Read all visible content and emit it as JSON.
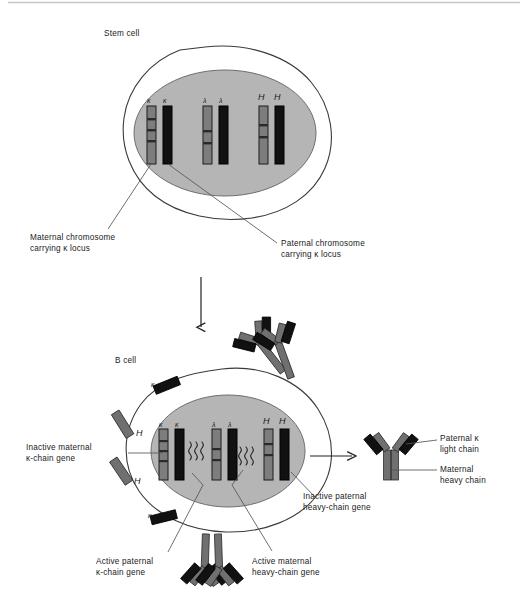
{
  "figure": {
    "type": "biology-diagram",
    "topic": "Allelic exclusion in immunoglobulin gene expression",
    "top_rule_color": "#bfbfbf"
  },
  "colors": {
    "cytoplasm": "#ffffff",
    "nucleus": "#b5b5b5",
    "maternal_chromosome": "#7d7d7d",
    "paternal_chromosome": "#111111",
    "heavy_chain_protein": "#707070",
    "light_chain_protein": "#111111",
    "outline": "#333333",
    "leader_line": "#555555"
  },
  "stem_cell": {
    "title": "Stem cell",
    "chromosome_pairs": [
      {
        "locus": "kappa",
        "labels": [
          "κ",
          "κ"
        ],
        "left": {
          "origin": "maternal",
          "shade": "gray"
        },
        "right": {
          "origin": "paternal",
          "shade": "black"
        }
      },
      {
        "locus": "lambda",
        "labels": [
          "λ",
          "λ"
        ],
        "left": {
          "origin": "maternal",
          "shade": "gray"
        },
        "right": {
          "origin": "paternal",
          "shade": "black"
        }
      },
      {
        "locus": "heavy",
        "labels": [
          "H",
          "H"
        ],
        "left": {
          "origin": "maternal",
          "shade": "gray"
        },
        "right": {
          "origin": "paternal",
          "shade": "black"
        }
      }
    ],
    "annotations": [
      {
        "id": "maternal-chromosome",
        "lines": [
          "Maternal chromosome",
          "carrying κ locus"
        ]
      },
      {
        "id": "paternal-chromosome",
        "lines": [
          "Paternal chromosome",
          "carrying κ locus"
        ]
      }
    ]
  },
  "transition": {
    "arrow": "down",
    "meaning": "differentiation"
  },
  "b_cell": {
    "title": "B cell",
    "chromosome_pairs": [
      {
        "locus": "kappa",
        "labels": [
          "κ",
          "κ"
        ],
        "left": {
          "origin": "maternal",
          "shade": "gray",
          "state": "inactive"
        },
        "right": {
          "origin": "paternal",
          "shade": "black",
          "state": "active"
        },
        "transcription": true
      },
      {
        "locus": "lambda",
        "labels": [
          "λ",
          "λ"
        ],
        "left": {
          "origin": "maternal",
          "shade": "gray",
          "state": "inactive"
        },
        "right": {
          "origin": "paternal",
          "shade": "black",
          "state": "inactive"
        },
        "transcription": false
      },
      {
        "locus": "heavy",
        "labels": [
          "H",
          "H"
        ],
        "left": {
          "origin": "maternal",
          "shade": "gray",
          "state": "active"
        },
        "right": {
          "origin": "paternal",
          "shade": "black",
          "state": "inactive"
        },
        "transcription": true
      }
    ],
    "cytoplasm_chains": [
      {
        "label": "κ",
        "kind": "light-chain",
        "shade": "black"
      },
      {
        "label": "κ",
        "kind": "light-chain",
        "shade": "black"
      },
      {
        "label": "H",
        "kind": "heavy-chain",
        "shade": "gray"
      },
      {
        "label": "H",
        "kind": "heavy-chain",
        "shade": "gray"
      }
    ],
    "surface_antibodies": 2,
    "annotations": [
      {
        "id": "inactive-maternal-kappa",
        "lines": [
          "Inactive maternal",
          "κ-chain gene"
        ]
      },
      {
        "id": "inactive-paternal-heavy",
        "lines": [
          "Inactive paternal",
          "heavy-chain gene"
        ]
      },
      {
        "id": "active-paternal-kappa",
        "lines": [
          "Active paternal",
          "κ-chain gene"
        ]
      },
      {
        "id": "active-maternal-heavy",
        "lines": [
          "Active maternal",
          "heavy-chain gene"
        ]
      }
    ]
  },
  "product": {
    "arrow": "right",
    "molecule": "antibody",
    "annotations": [
      {
        "id": "paternal-kappa-light-chain",
        "lines": [
          "Paternal κ",
          "light chain"
        ]
      },
      {
        "id": "maternal-heavy-chain",
        "lines": [
          "Maternal",
          "heavy chain"
        ]
      }
    ]
  }
}
